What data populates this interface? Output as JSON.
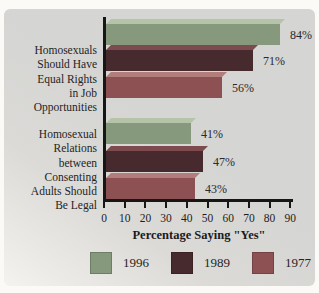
{
  "chart_data": {
    "type": "bar",
    "orientation": "horizontal",
    "title": "",
    "xlabel": "Percentage Saying \"Yes\"",
    "xticks": [
      0,
      10,
      20,
      30,
      40,
      50,
      60,
      70,
      80,
      90
    ],
    "xlim": [
      0,
      90
    ],
    "grid": false,
    "legend_position": "bottom",
    "categories": [
      "Homosexuals\nShould Have\nEqual Rights\nin Job\nOpportunities",
      "Homosexual\nRelations\nbetween\nConsenting\nAdults Should\nBe Legal"
    ],
    "series": [
      {
        "name": "1996",
        "values": [
          84,
          41
        ],
        "color": "#87997c",
        "top_color": "#b5c3a8"
      },
      {
        "name": "1989",
        "values": [
          71,
          47
        ],
        "color": "#472a2d",
        "top_color": "#7d4a4d"
      },
      {
        "name": "1977",
        "values": [
          56,
          43
        ],
        "color": "#8d5153",
        "top_color": "#b17e7b"
      }
    ],
    "value_labels": [
      "84%",
      "71%",
      "56%",
      "41%",
      "47%",
      "43%"
    ],
    "value_suffix": "%"
  },
  "colors": {
    "panel_background": "#d5d5d3",
    "axis": "#161616",
    "text": "#242424"
  }
}
